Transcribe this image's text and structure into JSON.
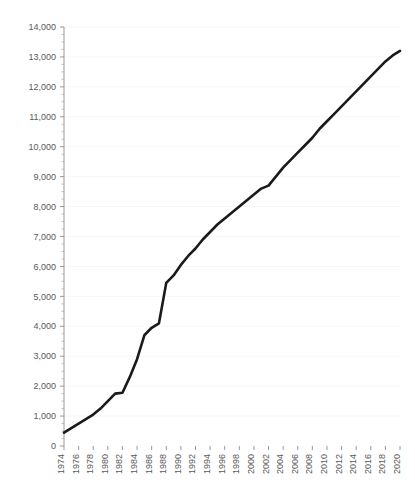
{
  "chart_data": {
    "type": "line",
    "title": "",
    "subtitle": "",
    "xlabel": "",
    "ylabel": "",
    "xlim": [
      1974,
      2020
    ],
    "ylim": [
      0,
      14000
    ],
    "ytick_step": 1000,
    "yminor_step": 250,
    "xtick_step": 2,
    "grid": true,
    "grid_axis": "y",
    "legend": false,
    "legend_position": "none",
    "line_color": "#1a1a1a",
    "axis_color": "#8c8c8c",
    "grid_color": "#f2f2f2",
    "tick_label_color": "#595959",
    "x_label_rotation": -90,
    "ytick_labels": [
      "0",
      "1,000",
      "2,000",
      "3,000",
      "4,000",
      "5,000",
      "6,000",
      "7,000",
      "8,000",
      "9,000",
      "10,000",
      "11,000",
      "12,000",
      "13,000",
      "14,000"
    ],
    "ytick_values": [
      0,
      1000,
      2000,
      3000,
      4000,
      5000,
      6000,
      7000,
      8000,
      9000,
      10000,
      11000,
      12000,
      13000,
      14000
    ],
    "xtick_labels": [
      "1974",
      "1976",
      "1978",
      "1980",
      "1982",
      "1984",
      "1986",
      "1988",
      "1990",
      "1992",
      "1994",
      "1996",
      "1998",
      "2000",
      "2002",
      "2004",
      "2006",
      "2008",
      "2010",
      "2012",
      "2014",
      "2016",
      "2018",
      "2020"
    ],
    "xtick_values": [
      1974,
      1976,
      1978,
      1980,
      1982,
      1984,
      1986,
      1988,
      1990,
      1992,
      1994,
      1996,
      1998,
      2000,
      2002,
      2004,
      2006,
      2008,
      2010,
      2012,
      2014,
      2016,
      2018,
      2020
    ],
    "x": [
      1974,
      1975,
      1976,
      1977,
      1978,
      1979,
      1980,
      1981,
      1982,
      1983,
      1984,
      1985,
      1986,
      1987,
      1988,
      1989,
      1990,
      1991,
      1992,
      1993,
      1994,
      1995,
      1996,
      1997,
      1998,
      1999,
      2000,
      2001,
      2002,
      2003,
      2004,
      2005,
      2006,
      2007,
      2008,
      2009,
      2010,
      2011,
      2012,
      2013,
      2014,
      2015,
      2016,
      2017,
      2018,
      2019,
      2020
    ],
    "values": [
      450,
      600,
      750,
      900,
      1050,
      1250,
      1500,
      1750,
      1780,
      2300,
      2900,
      3700,
      3950,
      4100,
      5450,
      5700,
      6050,
      6350,
      6600,
      6900,
      7150,
      7400,
      7600,
      7800,
      8000,
      8200,
      8400,
      8600,
      8700,
      9000,
      9300,
      9550,
      9800,
      10050,
      10300,
      10600,
      10850,
      11100,
      11350,
      11600,
      11850,
      12100,
      12350,
      12600,
      12850,
      13050,
      13200
    ],
    "series": [
      {
        "name": "series-1",
        "color": "#1a1a1a",
        "values": [
          450,
          600,
          750,
          900,
          1050,
          1250,
          1500,
          1750,
          1780,
          2300,
          2900,
          3700,
          3950,
          4100,
          5450,
          5700,
          6050,
          6350,
          6600,
          6900,
          7150,
          7400,
          7600,
          7800,
          8000,
          8200,
          8400,
          8600,
          8700,
          9000,
          9300,
          9550,
          9800,
          10050,
          10300,
          10600,
          10850,
          11100,
          11350,
          11600,
          11850,
          12100,
          12350,
          12600,
          12850,
          13050,
          13200
        ]
      }
    ]
  },
  "layout": {
    "plot_left": 64,
    "plot_right": 400,
    "plot_top": 27,
    "plot_bottom": 446
  }
}
